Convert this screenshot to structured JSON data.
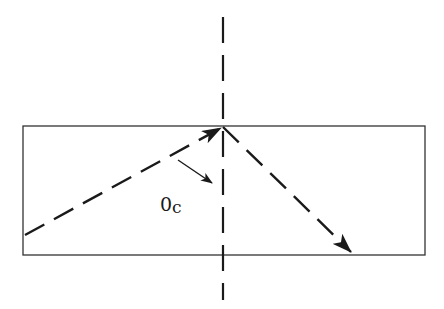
{
  "diagram": {
    "colors": {
      "stroke": "#1a1a1a",
      "box": "#333333",
      "background": "#ffffff"
    },
    "medium_box": {
      "x": 23,
      "y": 126,
      "width": 402,
      "height": 129
    },
    "normal_line": {
      "x": 223,
      "y1": 17,
      "y2": 300,
      "style": "dashed"
    },
    "incident_ray": {
      "x1": 25,
      "y1": 235,
      "x2": 221,
      "y2": 128,
      "style": "dashed",
      "arrow": "end"
    },
    "reflected_ray": {
      "x1": 223,
      "y1": 127,
      "x2": 351,
      "y2": 252,
      "style": "dashed",
      "arrow": "end"
    },
    "angle_pointer": {
      "x1": 178,
      "y1": 160,
      "x2": 212,
      "y2": 183,
      "style": "solid",
      "arrow": "end"
    },
    "angle_label": {
      "main": "0",
      "subscript": "c",
      "meaning": "critical angle"
    }
  }
}
